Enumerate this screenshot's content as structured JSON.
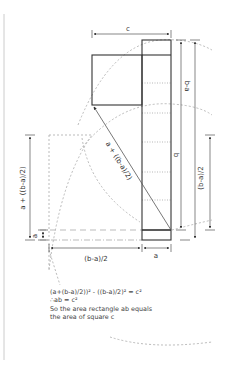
{
  "diagram": {
    "colors": {
      "solid": "#333333",
      "dashed": "#aaaaaa",
      "dimension": "#555555",
      "rule": "#cccccc"
    },
    "labels": {
      "c": "c",
      "b": "b",
      "b_minus_a": "b-a",
      "half_b_minus_a_vertical": "(b-a)/2",
      "a_plus_half_left": "a + ((b-a)/2)",
      "a_left": "a",
      "diagonal": "a + ((b-a)/2)",
      "half_b_minus_a_bottom": "(b-a)/2",
      "a_bottom": "a"
    },
    "caption": {
      "line1": "(a+(b-a)/2))² - ((b-a)/2)² = c²",
      "line2": "∴ab = c²",
      "line3": "So the area rectangle ab equals",
      "line4": "the area of square c"
    }
  }
}
